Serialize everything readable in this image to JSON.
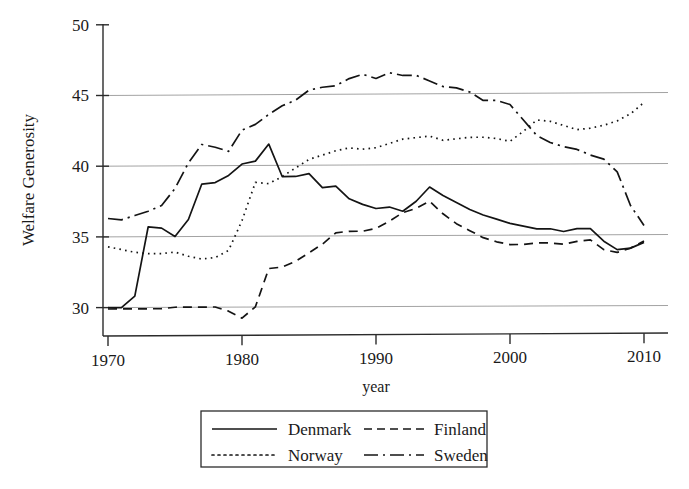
{
  "chart_data": {
    "type": "line",
    "title": "",
    "xlabel": "year",
    "ylabel": "Welfare Generosity",
    "xlim": [
      1970,
      2010
    ],
    "ylim": [
      28.5,
      50.5
    ],
    "xticks": [
      "1970",
      "1980",
      "1990",
      "2000",
      "2010"
    ],
    "yticks": [
      "30",
      "35",
      "40",
      "45",
      "50"
    ],
    "grid": "horizontal",
    "legend_position": "below-center",
    "legend_entries": [
      {
        "label": "Denmark",
        "style": "solid"
      },
      {
        "label": "Finland",
        "style": "dashed"
      },
      {
        "label": "Norway",
        "style": "dotted"
      },
      {
        "label": "Sweden",
        "style": "dash-dot"
      }
    ],
    "x": [
      1970,
      1971,
      1972,
      1973,
      1974,
      1975,
      1976,
      1977,
      1978,
      1979,
      1980,
      1981,
      1982,
      1983,
      1984,
      1985,
      1986,
      1987,
      1988,
      1989,
      1990,
      1991,
      1992,
      1993,
      1994,
      1995,
      1996,
      1997,
      1998,
      1999,
      2000,
      2001,
      2002,
      2003,
      2004,
      2005,
      2006,
      2007,
      2008,
      2009,
      2010
    ],
    "series": [
      {
        "name": "Denmark",
        "style": "solid",
        "values": [
          30.0,
          30.0,
          30.8,
          35.7,
          35.6,
          35.0,
          36.2,
          38.7,
          38.8,
          39.3,
          40.1,
          40.3,
          41.5,
          39.2,
          39.2,
          39.4,
          38.4,
          38.5,
          37.6,
          37.2,
          36.9,
          37.0,
          36.7,
          37.4,
          38.4,
          37.8,
          37.3,
          36.8,
          36.4,
          36.1,
          35.8,
          35.6,
          35.4,
          35.4,
          35.2,
          35.4,
          35.4,
          34.5,
          33.9,
          34.0,
          34.4
        ]
      },
      {
        "name": "Finland",
        "style": "dashed",
        "values": [
          29.9,
          29.9,
          29.9,
          29.9,
          29.9,
          30.0,
          30.0,
          30.0,
          30.0,
          29.7,
          29.2,
          30.0,
          32.7,
          32.8,
          33.2,
          33.8,
          34.4,
          35.2,
          35.3,
          35.3,
          35.5,
          36.0,
          36.6,
          36.9,
          37.4,
          36.5,
          35.8,
          35.3,
          34.8,
          34.5,
          34.3,
          34.3,
          34.4,
          34.4,
          34.3,
          34.5,
          34.6,
          33.9,
          33.7,
          34.0,
          34.5
        ]
      },
      {
        "name": "Norway",
        "style": "dotted",
        "values": [
          34.3,
          34.1,
          33.9,
          33.8,
          33.8,
          33.9,
          33.6,
          33.4,
          33.5,
          34.0,
          36.1,
          38.8,
          38.7,
          39.2,
          39.8,
          40.4,
          40.7,
          41.0,
          41.2,
          41.1,
          41.2,
          41.5,
          41.8,
          41.9,
          42.0,
          41.7,
          41.8,
          41.9,
          41.9,
          41.8,
          41.6,
          42.3,
          43.1,
          43.0,
          42.7,
          42.4,
          42.5,
          42.7,
          43.0,
          43.5,
          44.3
        ]
      },
      {
        "name": "Sweden",
        "style": "dash-dot",
        "values": [
          36.3,
          36.2,
          36.5,
          36.8,
          37.2,
          38.4,
          40.2,
          41.5,
          41.3,
          41.0,
          42.5,
          42.9,
          43.6,
          44.2,
          44.6,
          45.3,
          45.5,
          45.6,
          46.1,
          46.4,
          46.1,
          46.5,
          46.3,
          46.3,
          45.9,
          45.5,
          45.4,
          45.1,
          44.5,
          44.5,
          44.2,
          43.1,
          42.0,
          41.5,
          41.2,
          41.0,
          40.6,
          40.3,
          39.4,
          37.0,
          35.6
        ]
      }
    ]
  },
  "axes": {
    "y_title": "Welfare Generosity",
    "x_title": "year"
  }
}
